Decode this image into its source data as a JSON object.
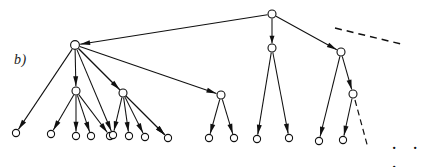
{
  "figure": {
    "panel_label": "b)",
    "ellipsis": "· · ·",
    "type": "directed-tree-diagram",
    "colors": {
      "ink": "#101010",
      "background": "#ffffff",
      "node_fill": "#ffffff"
    },
    "canvas": {
      "width": 436,
      "height": 167
    },
    "nodes": [
      {
        "id": "root",
        "x": 272,
        "y": 14,
        "r": 4.0,
        "level": 0
      },
      {
        "id": "h1",
        "x": 75,
        "y": 45,
        "r": 4.4,
        "level": 1
      },
      {
        "id": "h2",
        "x": 272,
        "y": 48,
        "r": 4.0,
        "level": 1
      },
      {
        "id": "h3",
        "x": 341,
        "y": 52,
        "r": 4.0,
        "level": 1
      },
      {
        "id": "n1",
        "x": 76,
        "y": 91,
        "r": 4.0,
        "level": 2
      },
      {
        "id": "n2",
        "x": 123,
        "y": 93,
        "r": 4.0,
        "level": 2
      },
      {
        "id": "n3",
        "x": 221,
        "y": 95,
        "r": 4.0,
        "level": 2
      },
      {
        "id": "n4",
        "x": 353,
        "y": 94,
        "r": 4.0,
        "level": 2
      },
      {
        "id": "L0",
        "x": 16,
        "y": 133,
        "r": 3.6,
        "level": 3
      },
      {
        "id": "L1",
        "x": 51,
        "y": 134,
        "r": 3.6,
        "level": 3
      },
      {
        "id": "L2",
        "x": 76,
        "y": 136,
        "r": 3.6,
        "level": 3
      },
      {
        "id": "L3",
        "x": 91,
        "y": 136,
        "r": 3.6,
        "level": 3
      },
      {
        "id": "L4",
        "x": 110,
        "y": 136,
        "r": 3.6,
        "level": 3
      },
      {
        "id": "L5",
        "x": 113,
        "y": 135,
        "r": 3.6,
        "level": 3
      },
      {
        "id": "L6",
        "x": 129,
        "y": 136,
        "r": 3.6,
        "level": 3
      },
      {
        "id": "L7",
        "x": 145,
        "y": 137,
        "r": 3.6,
        "level": 3
      },
      {
        "id": "L8",
        "x": 168,
        "y": 138,
        "r": 3.6,
        "level": 3
      },
      {
        "id": "L9",
        "x": 209,
        "y": 138,
        "r": 3.6,
        "level": 3
      },
      {
        "id": "L10",
        "x": 234,
        "y": 138,
        "r": 3.6,
        "level": 3
      },
      {
        "id": "L11",
        "x": 257,
        "y": 139,
        "r": 3.6,
        "level": 3
      },
      {
        "id": "L12",
        "x": 289,
        "y": 138,
        "r": 3.6,
        "level": 3
      },
      {
        "id": "L13",
        "x": 319,
        "y": 141,
        "r": 3.6,
        "level": 3
      },
      {
        "id": "L14",
        "x": 343,
        "y": 140,
        "r": 3.6,
        "level": 3
      }
    ],
    "edges": [
      {
        "from": "root",
        "to": "h1",
        "style": "solid",
        "arrow": true
      },
      {
        "from": "root",
        "to": "h2",
        "style": "solid",
        "arrow": true
      },
      {
        "from": "root",
        "to": "h3",
        "style": "solid",
        "arrow": true
      },
      {
        "from": "h1",
        "to": "L0",
        "style": "solid",
        "arrow": true
      },
      {
        "from": "h1",
        "to": "n1",
        "style": "solid",
        "arrow": true
      },
      {
        "from": "h1",
        "to": "n2",
        "style": "solid",
        "arrow": true
      },
      {
        "from": "h1",
        "to": "L5",
        "style": "solid",
        "arrow": true
      },
      {
        "from": "h1",
        "to": "L8",
        "style": "solid",
        "arrow": true
      },
      {
        "from": "h1",
        "to": "n3",
        "style": "solid",
        "arrow": true
      },
      {
        "from": "n1",
        "to": "L1",
        "style": "solid",
        "arrow": true
      },
      {
        "from": "n1",
        "to": "L2",
        "style": "solid",
        "arrow": true
      },
      {
        "from": "n1",
        "to": "L3",
        "style": "solid",
        "arrow": true
      },
      {
        "from": "n1",
        "to": "L4",
        "style": "solid",
        "arrow": true
      },
      {
        "from": "n2",
        "to": "L5",
        "style": "solid",
        "arrow": true
      },
      {
        "from": "n2",
        "to": "L6",
        "style": "solid",
        "arrow": true
      },
      {
        "from": "n2",
        "to": "L7",
        "style": "solid",
        "arrow": true
      },
      {
        "from": "n2",
        "to": "L8",
        "style": "solid",
        "arrow": true
      },
      {
        "from": "n3",
        "to": "L9",
        "style": "solid",
        "arrow": true
      },
      {
        "from": "n3",
        "to": "L10",
        "style": "solid",
        "arrow": true
      },
      {
        "from": "h2",
        "to": "L11",
        "style": "solid",
        "arrow": true
      },
      {
        "from": "h2",
        "to": "L12",
        "style": "solid",
        "arrow": true
      },
      {
        "from": "h3",
        "to": "L13",
        "style": "solid",
        "arrow": true
      },
      {
        "from": "h3",
        "to": "n4",
        "style": "solid",
        "arrow": true
      },
      {
        "from": "n4",
        "to": "L14",
        "style": "solid",
        "arrow": true
      }
    ],
    "dashed_edges": [
      {
        "name": "root-continuation",
        "x1": 335,
        "y1": 28,
        "x2": 401,
        "y2": 44
      },
      {
        "name": "subtree-continuation",
        "x1": 355,
        "y1": 100,
        "x2": 368,
        "y2": 148
      }
    ]
  }
}
